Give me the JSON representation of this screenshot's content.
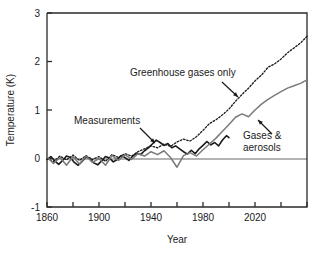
{
  "chart_data": {
    "type": "line",
    "title": "",
    "xlabel": "Year",
    "ylabel": "Temperature (K)",
    "xlim": [
      1860,
      2060
    ],
    "ylim": [
      -1,
      3
    ],
    "xticks": [
      1860,
      1880,
      1900,
      1920,
      1940,
      1960,
      1980,
      2000,
      2020,
      2040,
      2060
    ],
    "xtick_labels": [
      "1860",
      "",
      "1900",
      "",
      "1940",
      "",
      "1980",
      "",
      "2020",
      "",
      ""
    ],
    "yticks": [
      -1,
      0,
      1,
      2,
      3
    ],
    "ytick_labels": [
      "-1",
      "0",
      "1",
      "2",
      "3"
    ],
    "grid": false,
    "legend": "annotations",
    "zero_line": 0,
    "series": [
      {
        "name": "Measurements",
        "style": "solid",
        "color": "#1a1a1a",
        "width": 1.6,
        "x": [
          1860,
          1863,
          1866,
          1869,
          1872,
          1875,
          1878,
          1881,
          1884,
          1887,
          1890,
          1893,
          1896,
          1899,
          1902,
          1905,
          1908,
          1911,
          1914,
          1917,
          1920,
          1923,
          1926,
          1929,
          1932,
          1935,
          1938,
          1941,
          1944,
          1947,
          1950,
          1953,
          1956,
          1959,
          1962,
          1965,
          1968,
          1971,
          1974,
          1977,
          1980,
          1983,
          1986,
          1989,
          1992,
          1995,
          1998,
          2000
        ],
        "values": [
          -0.02,
          0.04,
          -0.05,
          -0.12,
          -0.04,
          0.05,
          0.02,
          -0.08,
          -0.14,
          -0.06,
          0.03,
          0.0,
          -0.09,
          -0.13,
          -0.05,
          0.04,
          0.01,
          -0.07,
          -0.02,
          0.06,
          0.02,
          -0.04,
          0.05,
          0.11,
          0.08,
          0.16,
          0.22,
          0.3,
          0.38,
          0.33,
          0.27,
          0.31,
          0.22,
          0.26,
          0.2,
          0.14,
          0.09,
          0.17,
          0.1,
          0.2,
          0.27,
          0.35,
          0.28,
          0.33,
          0.26,
          0.38,
          0.47,
          0.43
        ]
      },
      {
        "name": "Greenhouse gases only",
        "style": "dotted",
        "color": "#1a1a1a",
        "width": 1.3,
        "x": [
          1860,
          1865,
          1870,
          1875,
          1880,
          1885,
          1890,
          1895,
          1900,
          1905,
          1910,
          1915,
          1920,
          1925,
          1930,
          1935,
          1940,
          1945,
          1950,
          1955,
          1960,
          1965,
          1970,
          1975,
          1980,
          1985,
          1990,
          1995,
          2000,
          2005,
          2010,
          2015,
          2020,
          2025,
          2030,
          2035,
          2040,
          2045,
          2050,
          2055,
          2060
        ],
        "values": [
          0.0,
          -0.06,
          0.05,
          -0.03,
          0.07,
          -0.04,
          0.06,
          -0.02,
          0.04,
          -0.06,
          0.08,
          0.02,
          0.1,
          0.05,
          0.14,
          0.2,
          0.26,
          0.22,
          0.3,
          0.25,
          0.34,
          0.4,
          0.36,
          0.45,
          0.58,
          0.72,
          0.8,
          0.9,
          1.02,
          1.18,
          1.32,
          1.45,
          1.6,
          1.72,
          1.88,
          1.95,
          2.05,
          2.18,
          2.28,
          2.38,
          2.52
        ]
      },
      {
        "name": "Gases & aerosols",
        "style": "solid",
        "color": "#7a7a7a",
        "width": 1.5,
        "x": [
          1860,
          1865,
          1870,
          1875,
          1880,
          1885,
          1890,
          1895,
          1900,
          1905,
          1910,
          1915,
          1920,
          1925,
          1930,
          1935,
          1940,
          1945,
          1950,
          1955,
          1960,
          1965,
          1970,
          1975,
          1980,
          1985,
          1990,
          1995,
          2000,
          2005,
          2010,
          2015,
          2020,
          2025,
          2030,
          2035,
          2040,
          2045,
          2050,
          2055,
          2060
        ],
        "values": [
          0.03,
          -0.1,
          0.02,
          -0.14,
          0.04,
          -0.12,
          0.05,
          -0.08,
          0.0,
          -0.14,
          0.06,
          -0.04,
          0.08,
          -0.02,
          0.1,
          0.05,
          0.14,
          0.08,
          0.16,
          0.02,
          -0.18,
          0.06,
          0.12,
          0.05,
          0.18,
          0.3,
          0.42,
          0.56,
          0.7,
          0.85,
          0.92,
          0.86,
          1.0,
          1.12,
          1.22,
          1.3,
          1.38,
          1.45,
          1.5,
          1.55,
          1.62
        ]
      }
    ],
    "annotations": [
      {
        "text": "Greenhouse gases only",
        "x_px": 130,
        "y_px": 76,
        "arrow_from": [
          222,
          82
        ],
        "arrow_to": [
          238,
          97
        ]
      },
      {
        "text": "Measurements",
        "x_px": 74,
        "y_px": 124,
        "arrow_from": [
          140,
          128
        ],
        "arrow_to": [
          155,
          143
        ]
      },
      {
        "text": "Gases &",
        "text2": "aerosols",
        "x_px": 243,
        "y_px": 139,
        "arrow_from": [
          272,
          134
        ],
        "arrow_to": [
          258,
          120
        ]
      }
    ]
  }
}
